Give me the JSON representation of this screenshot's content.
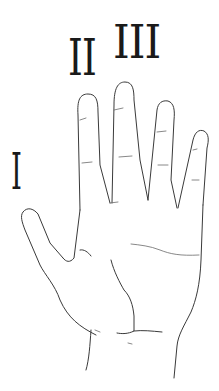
{
  "figure": {
    "labels": {
      "thumb": "I",
      "index": "II",
      "middle": "III"
    },
    "colors": {
      "background": "#ffffff",
      "line": "#3a3a3a",
      "numeral": "#1a1a1a"
    }
  }
}
